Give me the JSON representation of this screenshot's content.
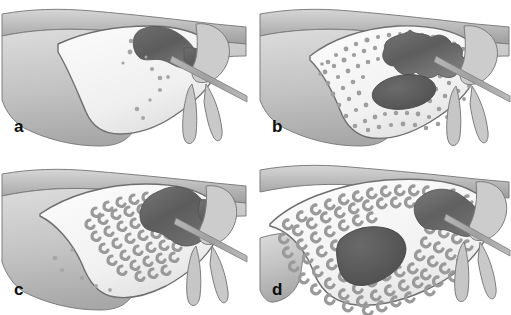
{
  "figure": {
    "type": "medical-illustration",
    "layout": {
      "rows": 2,
      "columns": 2,
      "gutter": "white"
    },
    "background_color": "#ffffff"
  },
  "palette": {
    "cortex_fill": "#b9b9b9",
    "cortex_shade": "#9c9c9c",
    "cortex_light": "#cfcfcf",
    "marrow_fill": "#f4f4f4",
    "marrow_shade": "#e3e3e3",
    "lesion_dark": "#5e5e5e",
    "lesion_mid": "#6f6f6f",
    "trabecula": "#9a9a9a",
    "speckle": "#a8a8a8",
    "outline": "#6e6e6e",
    "label_color": "#0d0d0d"
  },
  "panels": [
    {
      "id": "a",
      "label": "a",
      "position": "top-left",
      "stage_description": "Early stage: well-defined dark lesion in upper marrow space with sparse scattered punctate opacities; marrow cavity otherwise radiolucent.",
      "features": {
        "lesion": "solid dark irregular mass, upper-central",
        "trabecular_pattern": "sparse fine dots",
        "speckle_count": 11,
        "probe": "thin linear probe entering from right"
      }
    },
    {
      "id": "b",
      "label": "b",
      "position": "top-right",
      "stage_description": "Moderate stage: dense fine granular opacification fills the marrow cavity around the dark superior lesion, plus a second dark oval focus centrally.",
      "features": {
        "lesion": "dark irregular superior mass plus dark oval central focus",
        "trabecular_pattern": "dense fine granular stipple",
        "speckle_count": 120,
        "probe": "thin linear probe entering from right"
      }
    },
    {
      "id": "c",
      "label": "c",
      "position": "bottom-left",
      "stage_description": "Intermediate stage: coarse C-shaped trabecular markings cluster around the dark lesion in the superior marrow, with a few isolated dots inferiorly.",
      "features": {
        "lesion": "dark lobulated superior mass",
        "trabecular_pattern": "coarse C-shaped / ring trabeculae clustered peri-lesionally",
        "speckle_count": 46,
        "probe": "thin linear probe entering from right"
      }
    },
    {
      "id": "d",
      "label": "d",
      "position": "bottom-right",
      "stage_description": "Advanced stage: coarse C-shaped trabeculae fill the entire expanded marrow cavity, surrounding a large elongated dark central lesion and the dark superior mass.",
      "features": {
        "lesion": "large elongated dark central lesion plus dark superior mass",
        "trabecular_pattern": "coarse C-shaped trabeculae throughout cavity",
        "speckle_count": 150,
        "probe": "thin linear probe entering from right"
      }
    }
  ],
  "labels": {
    "a": "a",
    "b": "b",
    "c": "c",
    "d": "d"
  }
}
